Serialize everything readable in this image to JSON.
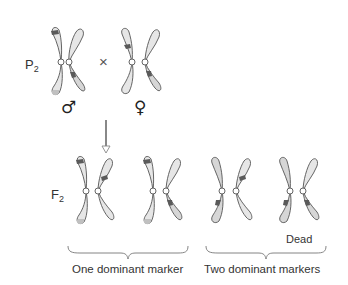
{
  "diagram": {
    "parent_generation": {
      "label": "P",
      "subscript": "2",
      "cross_symbol": "×",
      "male": {
        "symbol": "♂",
        "description": "Male chromosome pair"
      },
      "female": {
        "symbol": "♀",
        "description": "Female chromosome pair"
      }
    },
    "arrow": "down-arrow",
    "offspring_generation": {
      "label": "F",
      "subscript": "2",
      "groups": [
        {
          "label": "One dominant marker",
          "pairs": 2
        },
        {
          "label": "Two dominant markers",
          "pairs": 2,
          "annotation": "Dead"
        }
      ]
    },
    "colors": {
      "chromosome_light": "#e6e6e6",
      "chromosome_dark": "#c4c4c4",
      "outline": "#555555",
      "band": "#5a5a5a",
      "text": "#333333"
    }
  }
}
